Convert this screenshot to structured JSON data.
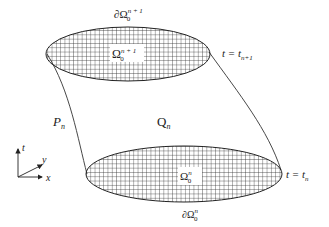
{
  "diagram": {
    "top_region": {
      "label": "Ω",
      "sup": "n + 1",
      "sub": "0",
      "boundary_label": "∂Ω",
      "boundary_sup": "n + 1",
      "boundary_sub": "0",
      "time_label": "t = t",
      "time_sub": "n+1"
    },
    "bottom_region": {
      "label": "Ω",
      "sup": "n",
      "sub": "0",
      "boundary_label": "∂Ω",
      "boundary_sup": "n",
      "boundary_sub": "0",
      "time_label": "t = t",
      "time_sub": "n"
    },
    "volume_label": "Q",
    "volume_sub": "n",
    "side_label": "P",
    "side_sub": "n",
    "axes": {
      "t": "t",
      "y": "y",
      "x": "x"
    },
    "colors": {
      "line": "#222222",
      "background": "#ffffff"
    }
  }
}
